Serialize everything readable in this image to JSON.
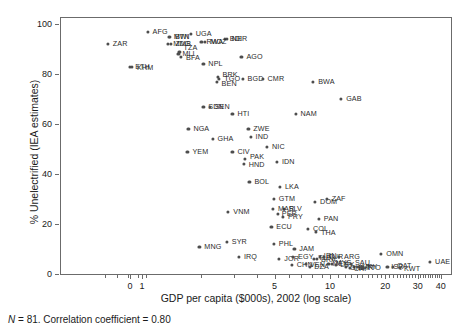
{
  "chart_data": {
    "type": "scatter",
    "title": "",
    "xlabel": "GDP per capita ($000s), 2002 (log scale)",
    "ylabel": "% Unelectrified (IEA estimates)",
    "caption_n": "N",
    "caption_rest": " = 81. Correlation coefficient = 0.80",
    "xscale": "log",
    "xlim": [
      0.45,
      45
    ],
    "ylim": [
      0,
      100
    ],
    "grid": false,
    "legend": "none",
    "xticks": [
      {
        "label": "0",
        "value": 0.55
      },
      {
        "label": "1",
        "value": 0.95
      },
      {
        "label": "5",
        "value": 5
      },
      {
        "label": "10",
        "value": 10
      },
      {
        "label": "20",
        "value": 20
      },
      {
        "label": "30",
        "value": 30
      },
      {
        "label": "40",
        "value": 40
      }
    ],
    "yticks": [
      {
        "label": "0",
        "value": 0
      },
      {
        "label": "20",
        "value": 20
      },
      {
        "label": "40",
        "value": 40
      },
      {
        "label": "60",
        "value": 60
      },
      {
        "label": "80",
        "value": 80
      },
      {
        "label": "100",
        "value": 100
      }
    ],
    "points": [
      {
        "label": "ZAR",
        "x": 0.62,
        "y": 92,
        "lx": 5,
        "ly": 0
      },
      {
        "label": "AFG",
        "x": 1.02,
        "y": 97,
        "lx": 5,
        "ly": 0
      },
      {
        "label": "BTN",
        "x": 1.35,
        "y": 95,
        "lx": 5,
        "ly": 0
      },
      {
        "label": "MWI",
        "x": 1.33,
        "y": 95,
        "lx": 5,
        "ly": 0
      },
      {
        "label": "UGA",
        "x": 1.75,
        "y": 96,
        "lx": 5,
        "ly": 0
      },
      {
        "label": "NER",
        "x": 2.75,
        "y": 94,
        "lx": 5,
        "ly": 0
      },
      {
        "label": "BDI",
        "x": 2.68,
        "y": 94,
        "lx": 5,
        "ly": 0
      },
      {
        "label": "MOZ",
        "x": 2.1,
        "y": 93,
        "lx": 5,
        "ly": 0
      },
      {
        "label": "RWA",
        "x": 2.0,
        "y": 93,
        "lx": 5,
        "ly": 0
      },
      {
        "label": "MDG",
        "x": 1.32,
        "y": 92,
        "lx": 5,
        "ly": 0
      },
      {
        "label": "ZMB",
        "x": 1.36,
        "y": 92,
        "lx": 5,
        "ly": 0
      },
      {
        "label": "TZA",
        "x": 1.52,
        "y": 89,
        "lx": 4,
        "ly": -4
      },
      {
        "label": "BFA",
        "x": 1.55,
        "y": 87,
        "lx": 5,
        "ly": 1
      },
      {
        "label": "MLI",
        "x": 1.5,
        "y": 88,
        "lx": 4,
        "ly": 0
      },
      {
        "label": "ETH",
        "x": 0.82,
        "y": 83,
        "lx": 5,
        "ly": 0
      },
      {
        "label": "KHM",
        "x": 0.84,
        "y": 83,
        "lx": 5,
        "ly": 1
      },
      {
        "label": "AGO",
        "x": 3.3,
        "y": 87,
        "lx": 5,
        "ly": 0
      },
      {
        "label": "NPL",
        "x": 2.05,
        "y": 84,
        "lx": 5,
        "ly": 0
      },
      {
        "label": "BRK",
        "x": 2.45,
        "y": 79,
        "lx": 5,
        "ly": -2
      },
      {
        "label": "TGO",
        "x": 2.5,
        "y": 78,
        "lx": 5,
        "ly": 0
      },
      {
        "label": "BEN",
        "x": 2.42,
        "y": 77,
        "lx": 5,
        "ly": 2
      },
      {
        "label": "BGD",
        "x": 3.35,
        "y": 78,
        "lx": 5,
        "ly": 0
      },
      {
        "label": "CMR",
        "x": 4.3,
        "y": 78,
        "lx": 5,
        "ly": 0
      },
      {
        "label": "BWA",
        "x": 8.1,
        "y": 77,
        "lx": 5,
        "ly": 0
      },
      {
        "label": "GAB",
        "x": 11.5,
        "y": 70,
        "lx": 5,
        "ly": 0
      },
      {
        "label": "SDN",
        "x": 2.05,
        "y": 67,
        "lx": 5,
        "ly": 0
      },
      {
        "label": "SEN",
        "x": 2.22,
        "y": 67,
        "lx": 5,
        "ly": 0
      },
      {
        "label": "HTI",
        "x": 2.95,
        "y": 64,
        "lx": 5,
        "ly": 0
      },
      {
        "label": "NAM",
        "x": 6.5,
        "y": 64,
        "lx": 5,
        "ly": 0
      },
      {
        "label": "NGA",
        "x": 1.7,
        "y": 58,
        "lx": 5,
        "ly": 0
      },
      {
        "label": "ZWE",
        "x": 3.6,
        "y": 58,
        "lx": 5,
        "ly": 0
      },
      {
        "label": "IND",
        "x": 3.7,
        "y": 55,
        "lx": 5,
        "ly": 0
      },
      {
        "label": "GHA",
        "x": 2.3,
        "y": 54,
        "lx": 5,
        "ly": 0
      },
      {
        "label": "NIC",
        "x": 4.55,
        "y": 51,
        "lx": 5,
        "ly": 0
      },
      {
        "label": "YEM",
        "x": 1.68,
        "y": 49,
        "lx": 5,
        "ly": 0
      },
      {
        "label": "CIV",
        "x": 2.95,
        "y": 49,
        "lx": 5,
        "ly": 0
      },
      {
        "label": "PAK",
        "x": 3.45,
        "y": 46,
        "lx": 5,
        "ly": -2
      },
      {
        "label": "HND",
        "x": 3.4,
        "y": 44,
        "lx": 5,
        "ly": 1
      },
      {
        "label": "IDN",
        "x": 5.15,
        "y": 45,
        "lx": 5,
        "ly": 0
      },
      {
        "label": "BOL",
        "x": 3.65,
        "y": 37,
        "lx": 5,
        "ly": 0
      },
      {
        "label": "LKA",
        "x": 5.35,
        "y": 35,
        "lx": 5,
        "ly": 0
      },
      {
        "label": "GTM",
        "x": 4.95,
        "y": 30,
        "lx": 5,
        "ly": 0
      },
      {
        "label": "DOM",
        "x": 8.3,
        "y": 29,
        "lx": 5,
        "ly": 0
      },
      {
        "label": "ZAF",
        "x": 9.6,
        "y": 30,
        "lx": 5,
        "ly": 0
      },
      {
        "label": "SLV",
        "x": 5.6,
        "y": 26,
        "lx": 5,
        "ly": 0
      },
      {
        "label": "MAR",
        "x": 4.9,
        "y": 26,
        "lx": 5,
        "ly": 0
      },
      {
        "label": "VNM",
        "x": 2.8,
        "y": 25,
        "lx": 5,
        "ly": 0
      },
      {
        "label": "PER",
        "x": 5.2,
        "y": 24,
        "lx": 4,
        "ly": 0
      },
      {
        "label": "PRY",
        "x": 5.55,
        "y": 23,
        "lx": 5,
        "ly": 0
      },
      {
        "label": "PAN",
        "x": 8.7,
        "y": 22,
        "lx": 5,
        "ly": 0
      },
      {
        "label": "ECU",
        "x": 4.8,
        "y": 19,
        "lx": 5,
        "ly": 0
      },
      {
        "label": "COL",
        "x": 7.6,
        "y": 18,
        "lx": 5,
        "ly": 0
      },
      {
        "label": "THA",
        "x": 8.4,
        "y": 17,
        "lx": 5,
        "ly": 1
      },
      {
        "label": "SYR",
        "x": 2.75,
        "y": 13,
        "lx": 5,
        "ly": 0
      },
      {
        "label": "MNG",
        "x": 1.95,
        "y": 11,
        "lx": 5,
        "ly": 0
      },
      {
        "label": "PHL",
        "x": 4.95,
        "y": 12,
        "lx": 5,
        "ly": 0
      },
      {
        "label": "JAM",
        "x": 6.4,
        "y": 10,
        "lx": 5,
        "ly": 0
      },
      {
        "label": "IRQ",
        "x": 3.2,
        "y": 7,
        "lx": 5,
        "ly": 0
      },
      {
        "label": "JOR",
        "x": 5.3,
        "y": 6,
        "lx": 5,
        "ly": 0
      },
      {
        "label": "EGY",
        "x": 6.3,
        "y": 7,
        "lx": 5,
        "ly": 0
      },
      {
        "label": "CHN",
        "x": 6.2,
        "y": 3.5,
        "lx": 5,
        "ly": 0
      },
      {
        "label": "TUN",
        "x": 8.2,
        "y": 6,
        "lx": 4,
        "ly": -1
      },
      {
        "label": "BRA",
        "x": 8.5,
        "y": 6,
        "lx": 4,
        "ly": 1
      },
      {
        "label": "IRN",
        "x": 8.8,
        "y": 7,
        "lx": 4,
        "ly": -1
      },
      {
        "label": "TUR",
        "x": 9.3,
        "y": 7,
        "lx": 4,
        "ly": 0
      },
      {
        "label": "ARG",
        "x": 11.2,
        "y": 7,
        "lx": 5,
        "ly": 0
      },
      {
        "label": "VEN",
        "x": 7.4,
        "y": 4,
        "lx": 4,
        "ly": 1
      },
      {
        "label": "DZA",
        "x": 7.8,
        "y": 3,
        "lx": 4,
        "ly": 0
      },
      {
        "label": "MEX",
        "x": 9.8,
        "y": 4,
        "lx": 4,
        "ly": 0
      },
      {
        "label": "MYS",
        "x": 10.2,
        "y": 4,
        "lx": 4,
        "ly": -1
      },
      {
        "label": "LBY",
        "x": 10.8,
        "y": 3.5,
        "lx": 4,
        "ly": 0
      },
      {
        "label": "SAU",
        "x": 13.0,
        "y": 4,
        "lx": 4,
        "ly": -1
      },
      {
        "label": "BHR",
        "x": 13.5,
        "y": 3,
        "lx": 4,
        "ly": 1
      },
      {
        "label": "CHL",
        "x": 12.2,
        "y": 3,
        "lx": 4,
        "ly": 1
      },
      {
        "label": "CRI",
        "x": 12.8,
        "y": 2.5,
        "lx": 4,
        "ly": 1
      },
      {
        "label": "URY",
        "x": 14.2,
        "y": 3,
        "lx": 4,
        "ly": 0
      },
      {
        "label": "TTO",
        "x": 15.0,
        "y": 3,
        "lx": 4,
        "ly": 1
      },
      {
        "label": "OMN",
        "x": 19.0,
        "y": 8,
        "lx": 5,
        "ly": 0
      },
      {
        "label": "ISR",
        "x": 20.5,
        "y": 3,
        "lx": 4,
        "ly": 0
      },
      {
        "label": "QAT",
        "x": 22.0,
        "y": 3,
        "lx": 4,
        "ly": -1
      },
      {
        "label": "KWT",
        "x": 24.0,
        "y": 2.5,
        "lx": 4,
        "ly": 1
      },
      {
        "label": "UAE",
        "x": 35.0,
        "y": 5,
        "lx": 5,
        "ly": 0
      }
    ]
  }
}
